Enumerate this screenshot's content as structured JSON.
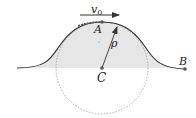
{
  "diagram": {
    "labels": {
      "velocity": "v",
      "velocity_sub": "0",
      "point_a": "A",
      "radius": "ρ",
      "center": "C",
      "point_b": "B"
    },
    "colors": {
      "curve": "#333333",
      "shade": "#e6e6e6",
      "circle": "#999999",
      "text": "#222222"
    }
  }
}
